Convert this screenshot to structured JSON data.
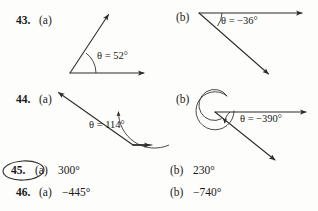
{
  "page": {
    "background": "#fdfdfc",
    "ink": "#2b2b2b"
  },
  "exercises": [
    {
      "number": "43.",
      "parts": [
        {
          "label": "(a)",
          "type": "diagram",
          "angle_label": "θ = 52°",
          "angle_value": 52,
          "direction": "counterclockwise"
        },
        {
          "label": "(b)",
          "type": "diagram",
          "angle_label": "θ = −36°",
          "angle_value": -36,
          "direction": "clockwise"
        }
      ]
    },
    {
      "number": "44.",
      "parts": [
        {
          "label": "(a)",
          "type": "diagram",
          "angle_label": "θ = 114°",
          "angle_value": 114,
          "direction": "counterclockwise"
        },
        {
          "label": "(b)",
          "type": "diagram",
          "angle_label": "θ = −390°",
          "angle_value": -390,
          "direction": "clockwise-multi-turn"
        }
      ]
    },
    {
      "number": "45.",
      "circled": true,
      "parts": [
        {
          "label": "(a)",
          "type": "value",
          "value": "300°"
        },
        {
          "label": "(b)",
          "type": "value",
          "value": "230°"
        }
      ]
    },
    {
      "number": "46.",
      "circled": false,
      "parts": [
        {
          "label": "(a)",
          "type": "value",
          "value": "−445°"
        },
        {
          "label": "(b)",
          "type": "value",
          "value": "−740°"
        }
      ]
    }
  ],
  "labels": {
    "theta_43a": "θ = 52°",
    "theta_43b": "θ = −36°",
    "theta_44a": "θ = 114°",
    "theta_44b": "θ = −390°"
  }
}
